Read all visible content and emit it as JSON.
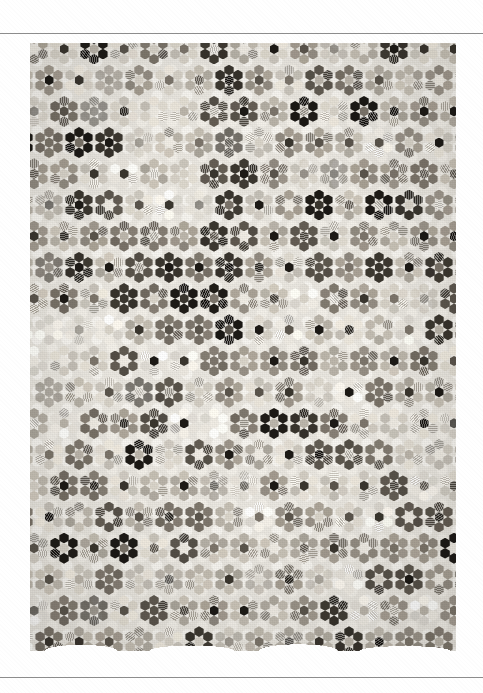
{
  "page": {
    "background_color": "#ffffff",
    "rules": [
      {
        "name": "top-rule",
        "y": 33,
        "color": "#8d8d8d"
      },
      {
        "name": "bottom-rule",
        "y": 677,
        "color": "#8d8d8d"
      }
    ]
  },
  "plate": {
    "caption": "",
    "subject": "hexagon patchwork quilt",
    "pattern_name": "Grandmother's Flower Garden",
    "medium": "black and white photograph",
    "frame": {
      "x": 30,
      "y": 43,
      "width": 426,
      "height": 608
    },
    "grid": {
      "columns": 14,
      "rows": 39,
      "col_pitch": 30,
      "row_pitch": 15.6,
      "rosette_span": 26
    },
    "palette": {
      "paper": "#ffffff",
      "path_light": "#efece5",
      "path_mid": "#ded9d0",
      "tone_1": "#f0ece4",
      "tone_2": "#d9d4ca",
      "tone_3": "#bdb7ac",
      "tone_4": "#9e978c",
      "tone_5": "#7d766c",
      "tone_6": "#5d574e",
      "tone_7": "#3c3831",
      "tone_8": "#1f1c18"
    },
    "tone_weights": [
      {
        "tone": "tone_1",
        "weight": 10
      },
      {
        "tone": "tone_2",
        "weight": 16
      },
      {
        "tone": "tone_3",
        "weight": 18
      },
      {
        "tone": "tone_4",
        "weight": 18
      },
      {
        "tone": "tone_5",
        "weight": 15
      },
      {
        "tone": "tone_6",
        "weight": 11
      },
      {
        "tone": "tone_7",
        "weight": 7
      },
      {
        "tone": "tone_8",
        "weight": 5
      }
    ],
    "center_tone_weights": [
      {
        "tone": "tone_1",
        "weight": 14
      },
      {
        "tone": "tone_2",
        "weight": 12
      },
      {
        "tone": "tone_3",
        "weight": 10
      },
      {
        "tone": "tone_5",
        "weight": 14
      },
      {
        "tone": "tone_6",
        "weight": 14
      },
      {
        "tone": "tone_7",
        "weight": 18
      },
      {
        "tone": "tone_8",
        "weight": 18
      }
    ]
  }
}
